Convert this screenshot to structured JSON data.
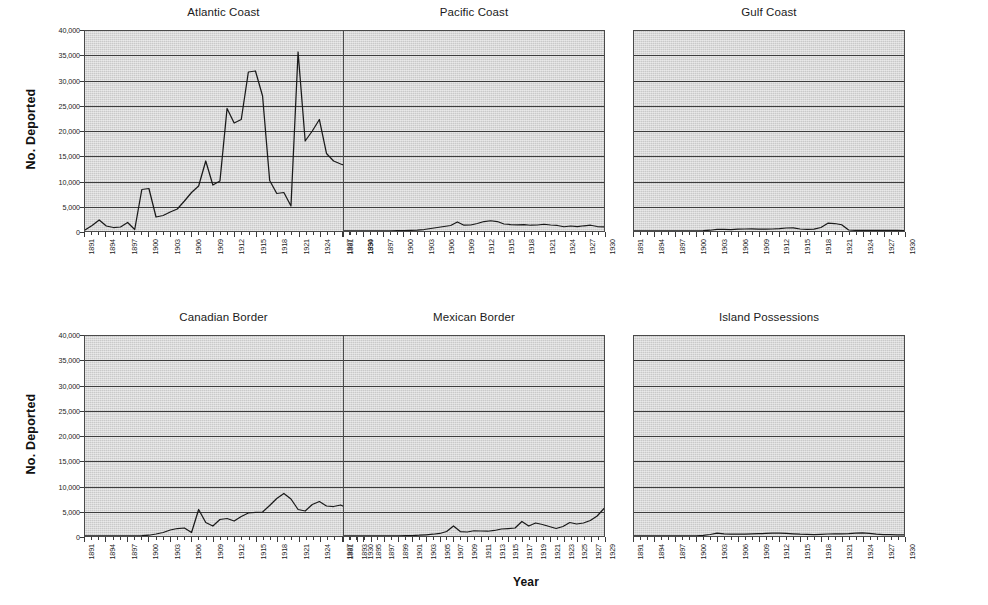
{
  "figure": {
    "axis_titles": {
      "y": "No. Deported",
      "x": "Year"
    }
  },
  "chart_data": {
    "type": "line",
    "title": "",
    "xlabel": "Year",
    "ylabel": "No. Deported",
    "ylim": [
      0,
      40000
    ],
    "ytick_labels": [
      "0",
      "5,000",
      "10,000",
      "15,000",
      "20,000",
      "25,000",
      "30,000",
      "35,000",
      "40,000"
    ],
    "ytick_values": [
      0,
      5000,
      10000,
      15000,
      20000,
      25000,
      30000,
      35000,
      40000
    ],
    "grid": "horizontal",
    "legend": "none",
    "layout": "small-multiples 2 rows x 3 columns",
    "panels": [
      {
        "title": "Atlantic Coast",
        "row": 0,
        "col": 0,
        "xlim": [
          1891,
          1930
        ],
        "xtick_step": 3,
        "xtick_labels": [
          "1891",
          "1894",
          "1897",
          "1900",
          "1903",
          "1906",
          "1909",
          "1912",
          "1915",
          "1918",
          "1921",
          "1924",
          "1927",
          "1930"
        ],
        "x": [
          1891,
          1892,
          1893,
          1894,
          1895,
          1896,
          1897,
          1898,
          1899,
          1900,
          1901,
          1902,
          1903,
          1904,
          1905,
          1906,
          1907,
          1908,
          1909,
          1910,
          1911,
          1912,
          1913,
          1914,
          1915,
          1916,
          1917,
          1918,
          1919,
          1920,
          1921,
          1922,
          1923,
          1924,
          1925,
          1926,
          1927,
          1928,
          1929,
          1930
        ],
        "y": [
          200,
          1100,
          2200,
          1000,
          700,
          800,
          1700,
          300,
          8300,
          8500,
          2800,
          3100,
          3800,
          4400,
          6000,
          7700,
          9000,
          14000,
          9200,
          10000,
          24500,
          21600,
          22300,
          31800,
          32000,
          27000,
          10100,
          7500,
          7700,
          5000,
          35800,
          18000,
          20000,
          22300,
          15500,
          14000,
          13400,
          12900,
          13000,
          14500
        ]
      },
      {
        "title": "Pacific Coast",
        "row": 0,
        "col": 1,
        "xlim": [
          1891,
          1930
        ],
        "xtick_step": 3,
        "xtick_labels": [
          "1891",
          "1894",
          "1897",
          "1900",
          "1903",
          "1906",
          "1909",
          "1912",
          "1915",
          "1918",
          "1921",
          "1924",
          "1927",
          "1930"
        ],
        "x": [
          1891,
          1892,
          1893,
          1894,
          1895,
          1896,
          1897,
          1898,
          1899,
          1900,
          1901,
          1902,
          1903,
          1904,
          1905,
          1906,
          1907,
          1908,
          1909,
          1910,
          1911,
          1912,
          1913,
          1914,
          1915,
          1916,
          1917,
          1918,
          1919,
          1920,
          1921,
          1922,
          1923,
          1924,
          1925,
          1926,
          1927,
          1928,
          1929,
          1930
        ],
        "y": [
          20,
          20,
          20,
          20,
          20,
          30,
          30,
          40,
          60,
          80,
          120,
          180,
          300,
          500,
          700,
          900,
          1100,
          1800,
          1150,
          1200,
          1500,
          1900,
          2050,
          1900,
          1400,
          1300,
          1250,
          1300,
          1150,
          1200,
          1350,
          1200,
          1100,
          850,
          1000,
          900,
          1050,
          1150,
          900,
          850
        ]
      },
      {
        "title": "Gulf Coast",
        "row": 0,
        "col": 2,
        "xlim": [
          1891,
          1930
        ],
        "xtick_step": 3,
        "xtick_labels": [
          "1891",
          "1894",
          "1897",
          "1900",
          "1903",
          "1906",
          "1909",
          "1912",
          "1915",
          "1918",
          "1921",
          "1924",
          "1927",
          "1930"
        ],
        "x": [
          1891,
          1892,
          1893,
          1894,
          1895,
          1896,
          1897,
          1898,
          1899,
          1900,
          1901,
          1902,
          1903,
          1904,
          1905,
          1906,
          1907,
          1908,
          1909,
          1910,
          1911,
          1912,
          1913,
          1914,
          1915,
          1916,
          1917,
          1918,
          1919,
          1920,
          1921,
          1922,
          1923,
          1924,
          1925,
          1926,
          1927,
          1928,
          1929,
          1930
        ],
        "y": [
          10,
          10,
          10,
          10,
          10,
          10,
          20,
          20,
          30,
          50,
          80,
          150,
          320,
          330,
          300,
          350,
          400,
          420,
          380,
          370,
          400,
          480,
          600,
          620,
          400,
          320,
          380,
          700,
          1550,
          1500,
          1250,
          200,
          120,
          110,
          120,
          130,
          130,
          120,
          110,
          100
        ]
      },
      {
        "title": "Canadian Border",
        "row": 1,
        "col": 0,
        "xlim": [
          1891,
          1930
        ],
        "xtick_step": 3,
        "xtick_labels": [
          "1891",
          "1894",
          "1897",
          "1900",
          "1903",
          "1906",
          "1909",
          "1912",
          "1915",
          "1918",
          "1921",
          "1924",
          "1927",
          "1930"
        ],
        "x": [
          1891,
          1892,
          1893,
          1894,
          1895,
          1896,
          1897,
          1898,
          1899,
          1900,
          1901,
          1902,
          1903,
          1904,
          1905,
          1906,
          1907,
          1908,
          1909,
          1910,
          1911,
          1912,
          1913,
          1914,
          1915,
          1916,
          1917,
          1918,
          1919,
          1920,
          1921,
          1922,
          1923,
          1924,
          1925,
          1926,
          1927,
          1928,
          1929,
          1930
        ],
        "y": [
          20,
          20,
          20,
          20,
          20,
          20,
          30,
          40,
          60,
          150,
          400,
          700,
          1200,
          1500,
          1600,
          700,
          5300,
          2700,
          2000,
          3300,
          3500,
          3000,
          3900,
          4600,
          4700,
          4800,
          6100,
          7500,
          8500,
          7400,
          5300,
          5000,
          6300,
          6900,
          6000,
          5900,
          6200,
          5500,
          5100,
          5500
        ]
      },
      {
        "title": "Mexican Border",
        "row": 1,
        "col": 1,
        "xlim": [
          1891,
          1929
        ],
        "xtick_step": 2,
        "xtick_labels": [
          "1891",
          "1893",
          "1895",
          "1897",
          "1899",
          "1901",
          "1903",
          "1905",
          "1907",
          "1909",
          "1911",
          "1913",
          "1915",
          "1917",
          "1919",
          "1921",
          "1923",
          "1925",
          "1927",
          "1929"
        ],
        "x": [
          1891,
          1892,
          1893,
          1894,
          1895,
          1896,
          1897,
          1898,
          1899,
          1900,
          1901,
          1902,
          1903,
          1904,
          1905,
          1906,
          1907,
          1908,
          1909,
          1910,
          1911,
          1912,
          1913,
          1914,
          1915,
          1916,
          1917,
          1918,
          1919,
          1920,
          1921,
          1922,
          1923,
          1924,
          1925,
          1926,
          1927,
          1928,
          1929
        ],
        "y": [
          10,
          10,
          10,
          10,
          10,
          10,
          20,
          20,
          40,
          60,
          100,
          150,
          250,
          350,
          500,
          900,
          2000,
          900,
          800,
          1050,
          1000,
          950,
          1100,
          1400,
          1500,
          1600,
          2900,
          2000,
          2600,
          2300,
          1900,
          1500,
          1900,
          2700,
          2400,
          2600,
          3100,
          4000,
          5500
        ]
      },
      {
        "title": "Island Possessions",
        "row": 1,
        "col": 2,
        "xlim": [
          1891,
          1930
        ],
        "xtick_step": 3,
        "xtick_labels": [
          "1891",
          "1894",
          "1897",
          "1900",
          "1903",
          "1906",
          "1909",
          "1912",
          "1915",
          "1918",
          "1921",
          "1924",
          "1927",
          "1930"
        ],
        "x": [
          1891,
          1892,
          1893,
          1894,
          1895,
          1896,
          1897,
          1898,
          1899,
          1900,
          1901,
          1902,
          1903,
          1904,
          1905,
          1906,
          1907,
          1908,
          1909,
          1910,
          1911,
          1912,
          1913,
          1914,
          1915,
          1916,
          1917,
          1918,
          1919,
          1920,
          1921,
          1922,
          1923,
          1924,
          1925,
          1926,
          1927,
          1928,
          1929,
          1930
        ],
        "y": [
          10,
          10,
          10,
          10,
          10,
          10,
          10,
          20,
          30,
          50,
          120,
          300,
          560,
          420,
          380,
          350,
          380,
          420,
          470,
          500,
          560,
          580,
          500,
          420,
          350,
          330,
          300,
          340,
          400,
          420,
          430,
          480,
          560,
          620,
          500,
          380,
          300,
          260,
          220,
          200
        ]
      }
    ]
  }
}
